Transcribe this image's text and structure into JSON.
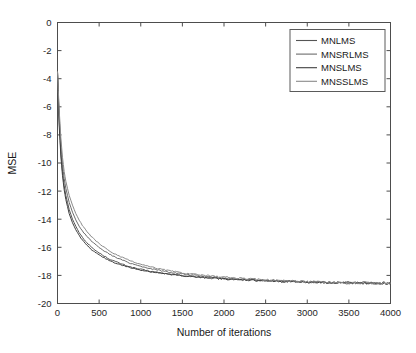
{
  "figure": {
    "background_color": "#ffffff",
    "axis_color": "#4d4d4d"
  },
  "chart_data": {
    "type": "line",
    "title": "",
    "subtitle": "",
    "xlabel": "Number of iterations",
    "ylabel": "MSE",
    "xlim": [
      0,
      4000
    ],
    "ylim": [
      -20,
      0
    ],
    "xticks": [
      0,
      500,
      1000,
      1500,
      2000,
      2500,
      3000,
      3500,
      4000
    ],
    "xticklabels": [
      "0",
      "500",
      "1000",
      "1500",
      "2000",
      "2500",
      "3000",
      "3500",
      "4000"
    ],
    "yticks": [
      0,
      -2,
      -4,
      -6,
      -8,
      -10,
      -12,
      -14,
      -16,
      -18,
      -20
    ],
    "yticklabels": [
      "0",
      "-2",
      "-4",
      "-6",
      "-8",
      "-10",
      "-12",
      "-14",
      "-16",
      "-18",
      "-20"
    ],
    "grid": false,
    "legend_position": "upper right",
    "x": [
      0,
      20,
      40,
      60,
      80,
      100,
      140,
      180,
      220,
      260,
      300,
      350,
      400,
      450,
      500,
      560,
      620,
      680,
      740,
      800,
      880,
      960,
      1040,
      1120,
      1200,
      1300,
      1400,
      1500,
      1600,
      1700,
      1800,
      1900,
      2000,
      2150,
      2300,
      2450,
      2600,
      2800,
      3000,
      3200,
      3400,
      3600,
      3800,
      4000
    ],
    "series": [
      {
        "name": "MNLMS",
        "color": "#555555",
        "values": [
          -3.5,
          -7.0,
          -9.2,
          -10.6,
          -11.6,
          -12.3,
          -13.3,
          -14.0,
          -14.5,
          -14.95,
          -15.3,
          -15.65,
          -15.95,
          -16.2,
          -16.4,
          -16.62,
          -16.82,
          -16.98,
          -17.12,
          -17.25,
          -17.4,
          -17.52,
          -17.62,
          -17.71,
          -17.79,
          -17.88,
          -17.95,
          -18.02,
          -18.07,
          -18.12,
          -18.16,
          -18.2,
          -18.24,
          -18.29,
          -18.33,
          -18.36,
          -18.4,
          -18.44,
          -18.47,
          -18.5,
          -18.52,
          -18.54,
          -18.55,
          -18.56
        ]
      },
      {
        "name": "MNSRLMS",
        "color": "#6b6b6b",
        "values": [
          -3.5,
          -6.6,
          -8.7,
          -10.1,
          -11.1,
          -11.8,
          -12.8,
          -13.5,
          -14.05,
          -14.5,
          -14.85,
          -15.2,
          -15.5,
          -15.78,
          -16.0,
          -16.25,
          -16.47,
          -16.66,
          -16.82,
          -16.96,
          -17.14,
          -17.28,
          -17.41,
          -17.52,
          -17.61,
          -17.72,
          -17.82,
          -17.9,
          -17.97,
          -18.03,
          -18.08,
          -18.13,
          -18.18,
          -18.24,
          -18.29,
          -18.33,
          -18.37,
          -18.42,
          -18.46,
          -18.49,
          -18.51,
          -18.53,
          -18.55,
          -18.56
        ]
      },
      {
        "name": "MNSLMS",
        "color": "#3f3f3f",
        "values": [
          -3.5,
          -7.3,
          -9.5,
          -10.9,
          -11.9,
          -12.6,
          -13.6,
          -14.25,
          -14.75,
          -15.15,
          -15.5,
          -15.85,
          -16.12,
          -16.35,
          -16.55,
          -16.75,
          -16.93,
          -17.08,
          -17.21,
          -17.32,
          -17.46,
          -17.57,
          -17.66,
          -17.74,
          -17.81,
          -17.9,
          -17.97,
          -18.03,
          -18.08,
          -18.13,
          -18.17,
          -18.21,
          -18.25,
          -18.3,
          -18.34,
          -18.37,
          -18.41,
          -18.45,
          -18.48,
          -18.5,
          -18.52,
          -18.54,
          -18.55,
          -18.56
        ]
      },
      {
        "name": "MNSSLMS",
        "color": "#8a8a8a",
        "values": [
          -3.5,
          -6.2,
          -8.2,
          -9.6,
          -10.6,
          -11.3,
          -12.3,
          -13.0,
          -13.6,
          -14.05,
          -14.45,
          -14.85,
          -15.2,
          -15.48,
          -15.73,
          -16.0,
          -16.24,
          -16.45,
          -16.63,
          -16.78,
          -16.98,
          -17.14,
          -17.28,
          -17.4,
          -17.5,
          -17.62,
          -17.73,
          -17.82,
          -17.9,
          -17.97,
          -18.02,
          -18.07,
          -18.12,
          -18.19,
          -18.25,
          -18.29,
          -18.34,
          -18.4,
          -18.44,
          -18.47,
          -18.5,
          -18.52,
          -18.54,
          -18.55
        ]
      }
    ]
  }
}
